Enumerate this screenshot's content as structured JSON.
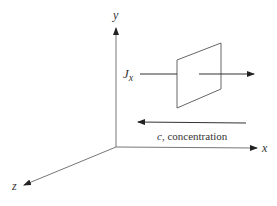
{
  "diagram": {
    "axes": {
      "x_label": "x",
      "y_label": "y",
      "z_label": "z"
    },
    "flux": {
      "symbol": "J",
      "subscript": "x"
    },
    "concentration_label_var": "c",
    "concentration_label_rest": ", concentration",
    "colors": {
      "line": "#555555",
      "arrow": "#222222",
      "text": "#333333"
    }
  }
}
